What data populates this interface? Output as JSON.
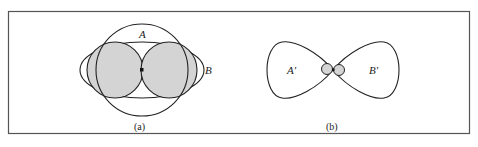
{
  "figure": {
    "panel_a": {
      "label_A": "A",
      "label_B": "B",
      "caption": "(a)"
    },
    "panel_b": {
      "label_A": "A'",
      "label_B": "B'",
      "caption": "(b)"
    }
  },
  "colors": {
    "line": "#222222",
    "shade": "#d4d4d4",
    "background": "#ffffff"
  }
}
